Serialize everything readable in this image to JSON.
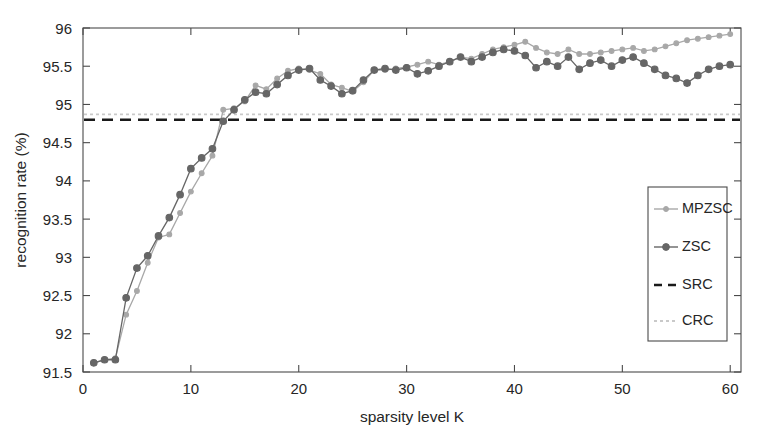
{
  "chart_data": {
    "type": "line",
    "title": "",
    "xlabel": "sparsity level K",
    "ylabel": "recognition rate (%)",
    "xlim": [
      0,
      61
    ],
    "ylim": [
      91.5,
      96
    ],
    "xticks": [
      0,
      10,
      20,
      30,
      40,
      50,
      60
    ],
    "xtick_labels": [
      "0",
      "10",
      "20",
      "30",
      "40",
      "50",
      "60"
    ],
    "yticks": [
      91.5,
      92,
      92.5,
      93,
      93.5,
      94,
      94.5,
      95,
      95.5,
      96
    ],
    "ytick_labels": [
      "91.5",
      "92",
      "92.5",
      "93",
      "93.5",
      "94",
      "94.5",
      "95",
      "95.5",
      "96"
    ],
    "grid": false,
    "legend_position": "right-middle",
    "legend_entries": [
      "MPZSC",
      "ZSC",
      "SRC",
      "CRC"
    ],
    "x": [
      1,
      2,
      3,
      4,
      5,
      6,
      7,
      8,
      9,
      10,
      11,
      12,
      13,
      14,
      15,
      16,
      17,
      18,
      19,
      20,
      21,
      22,
      23,
      24,
      25,
      26,
      27,
      28,
      29,
      30,
      31,
      32,
      33,
      34,
      35,
      36,
      37,
      38,
      39,
      40,
      41,
      42,
      43,
      44,
      45,
      46,
      47,
      48,
      49,
      50,
      51,
      52,
      53,
      54,
      55,
      56,
      57,
      58,
      59,
      60
    ],
    "series": [
      {
        "name": "MPZSC",
        "color": "#a8a8a8",
        "marker": "circle-small",
        "linestyle": "solid",
        "values": [
          91.62,
          91.66,
          91.68,
          92.25,
          92.56,
          92.93,
          93.26,
          93.3,
          93.58,
          93.86,
          94.1,
          94.33,
          94.93,
          94.95,
          95.04,
          95.25,
          95.2,
          95.34,
          95.44,
          95.47,
          95.45,
          95.4,
          95.26,
          95.22,
          95.17,
          95.29,
          95.45,
          95.45,
          95.47,
          95.49,
          95.52,
          95.56,
          95.52,
          95.56,
          95.62,
          95.6,
          95.66,
          95.72,
          95.75,
          95.78,
          95.82,
          95.74,
          95.68,
          95.66,
          95.72,
          95.66,
          95.66,
          95.68,
          95.7,
          95.72,
          95.74,
          95.7,
          95.72,
          95.76,
          95.8,
          95.84,
          95.86,
          95.88,
          95.9,
          95.92
        ]
      },
      {
        "name": "ZSC",
        "color": "#666666",
        "marker": "circle-filled",
        "linestyle": "solid",
        "values": [
          91.62,
          91.66,
          91.66,
          92.47,
          92.86,
          93.02,
          93.28,
          93.52,
          93.82,
          94.16,
          94.3,
          94.42,
          94.78,
          94.93,
          95.06,
          95.16,
          95.14,
          95.26,
          95.38,
          95.45,
          95.47,
          95.32,
          95.24,
          95.14,
          95.18,
          95.32,
          95.45,
          95.47,
          95.45,
          95.48,
          95.4,
          95.44,
          95.5,
          95.56,
          95.62,
          95.56,
          95.62,
          95.68,
          95.72,
          95.7,
          95.64,
          95.48,
          95.56,
          95.5,
          95.62,
          95.46,
          95.54,
          95.58,
          95.5,
          95.58,
          95.62,
          95.54,
          95.46,
          95.38,
          95.34,
          95.28,
          95.38,
          95.46,
          95.5,
          95.52
        ]
      }
    ],
    "reference_lines": [
      {
        "name": "SRC",
        "value": 94.8,
        "color": "#1a1a1a",
        "linestyle": "dashed"
      },
      {
        "name": "CRC",
        "value": 94.87,
        "color": "#c9c9c9",
        "linestyle": "dotted"
      }
    ]
  }
}
